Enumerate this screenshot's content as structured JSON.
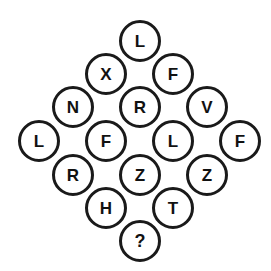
{
  "puzzle": {
    "title": "Letter Diamond Puzzle",
    "shape": "diamond",
    "circle_diameter_px": 42,
    "stroke_color": "#1a1a1a",
    "fill_color": "#ffffff",
    "text_color": "#111111",
    "background_color": "#ffffff",
    "rows": [
      {
        "index": 1,
        "y": 41,
        "cells": [
          {
            "label": "L",
            "x": 140,
            "y": 41,
            "is_unknown": false
          }
        ]
      },
      {
        "index": 2,
        "y": 74,
        "cells": [
          {
            "label": "X",
            "x": 106,
            "y": 74,
            "is_unknown": false
          },
          {
            "label": "F",
            "x": 173,
            "y": 74,
            "is_unknown": false
          }
        ]
      },
      {
        "index": 3,
        "y": 107,
        "cells": [
          {
            "label": "N",
            "x": 73,
            "y": 107,
            "is_unknown": false
          },
          {
            "label": "R",
            "x": 140,
            "y": 107,
            "is_unknown": false
          },
          {
            "label": "V",
            "x": 207,
            "y": 107,
            "is_unknown": false
          }
        ]
      },
      {
        "index": 4,
        "y": 141,
        "cells": [
          {
            "label": "L",
            "x": 39,
            "y": 141,
            "is_unknown": false
          },
          {
            "label": "F",
            "x": 106,
            "y": 141,
            "is_unknown": false
          },
          {
            "label": "L",
            "x": 173,
            "y": 141,
            "is_unknown": false
          },
          {
            "label": "F",
            "x": 240,
            "y": 141,
            "is_unknown": false
          }
        ]
      },
      {
        "index": 5,
        "y": 175,
        "cells": [
          {
            "label": "R",
            "x": 73,
            "y": 175,
            "is_unknown": false
          },
          {
            "label": "Z",
            "x": 140,
            "y": 175,
            "is_unknown": false
          },
          {
            "label": "Z",
            "x": 207,
            "y": 175,
            "is_unknown": false
          }
        ]
      },
      {
        "index": 6,
        "y": 208,
        "cells": [
          {
            "label": "H",
            "x": 106,
            "y": 208,
            "is_unknown": false
          },
          {
            "label": "T",
            "x": 173,
            "y": 208,
            "is_unknown": false
          }
        ]
      },
      {
        "index": 7,
        "y": 241,
        "cells": [
          {
            "label": "?",
            "x": 140,
            "y": 241,
            "is_unknown": true
          }
        ]
      }
    ]
  }
}
